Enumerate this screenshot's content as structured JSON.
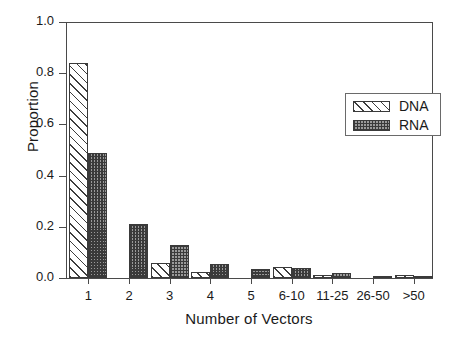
{
  "chart_data": {
    "type": "bar",
    "title": "",
    "subtitle": "",
    "xlabel": "Number of Vectors",
    "ylabel": "Proportion",
    "categories": [
      "1",
      "2",
      "3",
      "4",
      "5",
      "6-10",
      "11-25",
      "26-50",
      ">50"
    ],
    "series": [
      {
        "name": "DNA",
        "fill": "diagonal-hatch",
        "values": [
          0.84,
          0.0,
          0.06,
          0.025,
          0.0,
          0.042,
          0.013,
          0.0,
          0.013
        ]
      },
      {
        "name": "RNA",
        "fill": "checkerboard-hatch",
        "values": [
          0.49,
          0.21,
          0.13,
          0.055,
          0.035,
          0.04,
          0.02,
          0.006,
          0.003
        ]
      }
    ],
    "ylim": [
      0.0,
      1.0
    ],
    "yticks": [
      "0.0",
      "0.2",
      "0.4",
      "0.6",
      "0.8",
      "1.0"
    ],
    "ytick_values": [
      0.0,
      0.2,
      0.4,
      0.6,
      0.8,
      1.0
    ],
    "grid": false,
    "legend_position": "upper-right",
    "legend_entries": [
      "DNA",
      "RNA"
    ],
    "annotations": [],
    "colors": {
      "axis": "#4a4a4a",
      "bar_outline": "#3a3a3a",
      "hatch": "#3d3d3d",
      "background": "#ffffff",
      "text": "#1a1a1a"
    }
  }
}
